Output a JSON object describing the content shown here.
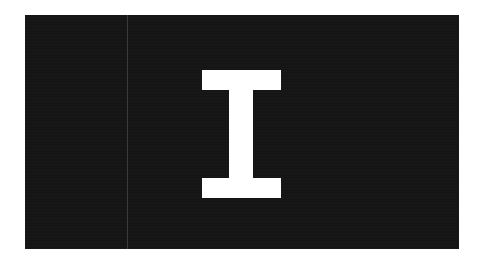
{
  "glyph": {
    "letter": "I",
    "icon": "text-cursor-i-beam-icon",
    "color": "#ffffff"
  },
  "panel": {
    "background": "#161616",
    "divider_color": "#3a3a3a"
  }
}
